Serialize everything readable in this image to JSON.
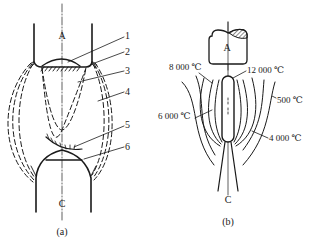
{
  "figure": {
    "panel_a": {
      "caption": "(a)",
      "top_electrode_label": "A",
      "bottom_electrode_label": "C",
      "callouts": [
        {
          "id": "1",
          "label": "1"
        },
        {
          "id": "2",
          "label": "2"
        },
        {
          "id": "3",
          "label": "3"
        },
        {
          "id": "4",
          "label": "4"
        },
        {
          "id": "5",
          "label": "5"
        },
        {
          "id": "6",
          "label": "6"
        }
      ]
    },
    "panel_b": {
      "caption": "(b)",
      "top_electrode_label": "A",
      "bottom_electrode_label": "C",
      "isotherms": [
        {
          "id": "t8000",
          "label": "8 000 ℃"
        },
        {
          "id": "t12000",
          "label": "12 000 ℃"
        },
        {
          "id": "t500",
          "label": "500 ℃"
        },
        {
          "id": "t6000",
          "label": "6 000 ℃"
        },
        {
          "id": "t4000",
          "label": "4 000 ℃"
        }
      ]
    }
  },
  "colors": {
    "ink": "#1a1a1a",
    "background": "#ffffff"
  }
}
